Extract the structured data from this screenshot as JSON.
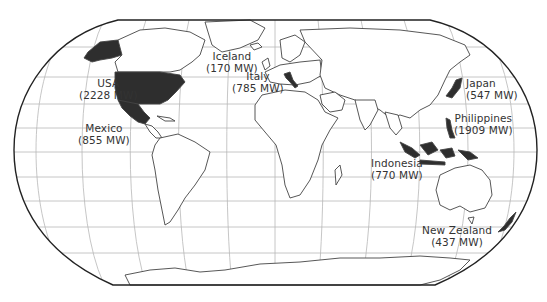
{
  "map": {
    "projection": "robinson",
    "colors": {
      "background": "#ffffff",
      "outline": "#222222",
      "graticule": "#b8b8b8",
      "land_fill": "#ffffff",
      "land_stroke": "#444444",
      "highlight_fill": "#2e2e2e",
      "label_text": "#333333"
    },
    "labels": [
      {
        "id": "usa",
        "country": "USA",
        "value": "(2228 MW)"
      },
      {
        "id": "mexico",
        "country": "Mexico",
        "value": "(855 MW)"
      },
      {
        "id": "iceland",
        "country": "Iceland",
        "value": "(170 MW)"
      },
      {
        "id": "italy",
        "country": "Italy",
        "value": "(785 MW)"
      },
      {
        "id": "japan",
        "country": "Japan",
        "value": "(547 MW)"
      },
      {
        "id": "philippines",
        "country": "Philippines",
        "value": "(1909 MW)"
      },
      {
        "id": "indonesia",
        "country": "Indonesia",
        "value": "(770 MW)"
      },
      {
        "id": "new-zealand",
        "country": "New Zealand",
        "value": "(437 MW)"
      }
    ]
  }
}
